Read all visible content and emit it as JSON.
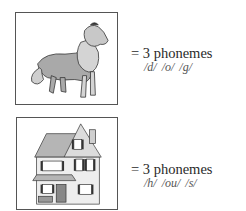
{
  "items": [
    {
      "picture": "dog-illustration",
      "equation": "= 3 phonemes",
      "phonemes": "/d/ /o/ /g/"
    },
    {
      "picture": "house-illustration",
      "equation": "= 3 phonemes",
      "phonemes": "/h/ /ou/ /s/"
    }
  ]
}
